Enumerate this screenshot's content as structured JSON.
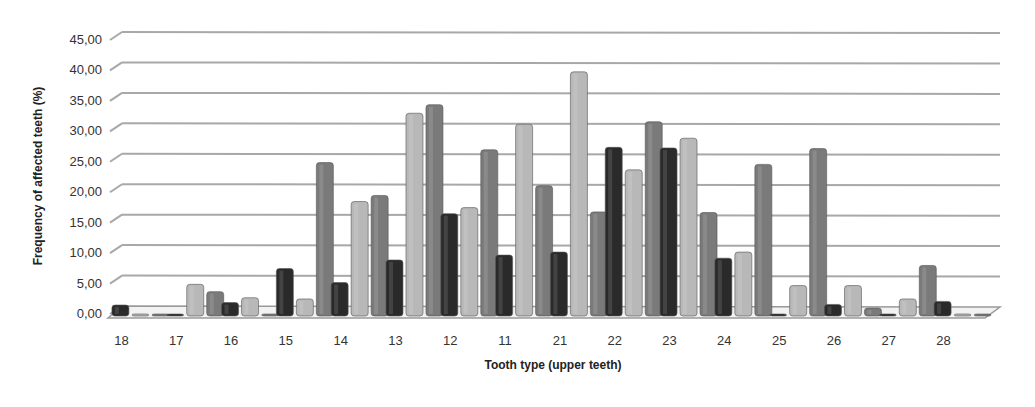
{
  "chart_data": {
    "type": "bar",
    "title": "",
    "xlabel": "Tooth type (upper teeth)",
    "ylabel": "Frequency of affected teeth (%)",
    "ylim": [
      0,
      45
    ],
    "yticks": [
      "0,00",
      "5,00",
      "10,00",
      "15,00",
      "20,00",
      "25,00",
      "30,00",
      "35,00",
      "40,00",
      "45,00"
    ],
    "grid": true,
    "legend": "none",
    "style": "3D clustered column, grayscale",
    "categories": [
      "18",
      "17",
      "16",
      "15",
      "14",
      "13",
      "12",
      "11",
      "21",
      "22",
      "23",
      "24",
      "25",
      "26",
      "27",
      "28"
    ],
    "series": [
      {
        "name": "Series 1 (dark)",
        "color": "#2a2a2a",
        "values": [
          1.8,
          0.3,
          2.2,
          7.8,
          5.5,
          9.2,
          16.8,
          10.0,
          10.5,
          27.7,
          27.6,
          9.5,
          0.2,
          1.9,
          0.2,
          2.4
        ]
      },
      {
        "name": "Series 2 (light)",
        "color": "#b8b8b8",
        "values": [
          0.3,
          5.2,
          3.0,
          2.8,
          18.8,
          33.3,
          17.8,
          31.5,
          40.1,
          24.0,
          29.2,
          10.5,
          5.0,
          5.0,
          2.8,
          0.2
        ]
      },
      {
        "name": "Series 3 (medium)",
        "color": "#7a7a7a",
        "values": [
          0.2,
          4.0,
          0.3,
          25.2,
          19.8,
          34.7,
          27.3,
          21.4,
          17.1,
          31.9,
          17.0,
          24.9,
          27.5,
          1.3,
          8.3,
          0.2
        ]
      }
    ]
  }
}
